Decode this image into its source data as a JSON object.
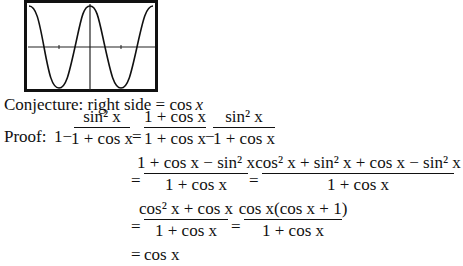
{
  "graph": {
    "description": "Calculator graph window showing cosine curve",
    "function": "cos x",
    "axes": true,
    "frame_color": "#111111"
  },
  "conjecture": {
    "label": "Conjecture: right side = ",
    "value": "cos",
    "var": "x"
  },
  "proof": {
    "label": "Proof:",
    "line1": {
      "lhs_lead": "1−",
      "f1_num": "sin² x",
      "f1_den": "1 + cos x",
      "eq": "=",
      "f2_num": "1 + cos x",
      "f2_den": "1 + cos x",
      "minus": "−",
      "f3_num": "sin² x",
      "f3_den": "1 + cos x"
    },
    "line2": {
      "eq": "=",
      "f1_num": "1 + cos x − sin² x",
      "f1_den": "1 + cos x",
      "eq2": "=",
      "f2_num": "cos² x + sin² x + cos x − sin² x",
      "f2_den": "1 + cos x"
    },
    "line3": {
      "eq": "=",
      "f1_num": "cos² x + cos x",
      "f1_den": "1 + cos x",
      "eq2": "=",
      "f2_num": "cos x(cos x + 1)",
      "f2_den": "1 + cos x"
    },
    "line4": {
      "eq": "=",
      "result": "cos x"
    }
  }
}
